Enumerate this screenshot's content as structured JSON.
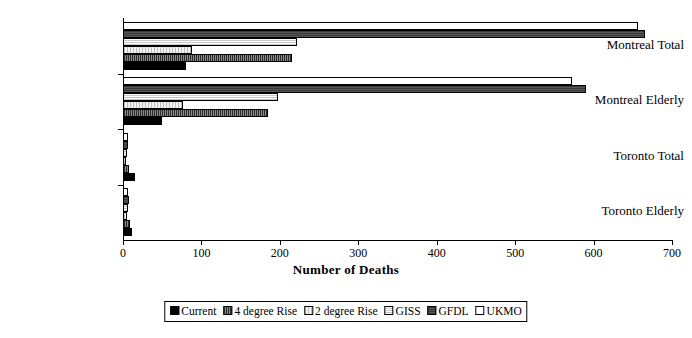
{
  "chart_data": {
    "type": "bar",
    "orientation": "horizontal",
    "title": "",
    "xlabel": "Number of Deaths",
    "ylabel": "",
    "xlim": [
      0,
      700
    ],
    "xticks": [
      0,
      100,
      200,
      300,
      400,
      500,
      600,
      700
    ],
    "grid": false,
    "legend_position": "bottom",
    "categories": [
      "Montreal Total",
      "Montreal Elderly",
      "Toronto Total",
      "Toronto Elderly"
    ],
    "series": [
      {
        "name": "Current",
        "values": [
          80,
          50,
          15,
          12
        ]
      },
      {
        "name": "4 degree Rise",
        "values": [
          215,
          185,
          8,
          9
        ]
      },
      {
        "name": "2 degree Rise",
        "values": [
          88,
          77,
          4,
          5
        ]
      },
      {
        "name": "GISS",
        "values": [
          222,
          198,
          5,
          6
        ]
      },
      {
        "name": "GFDL",
        "values": [
          665,
          590,
          7,
          8
        ]
      },
      {
        "name": "UKMO",
        "values": [
          657,
          573,
          6,
          7
        ]
      }
    ]
  },
  "axis": {
    "x_title": "Number of Deaths",
    "tick_labels": [
      "0",
      "100",
      "200",
      "300",
      "400",
      "500",
      "600",
      "700"
    ]
  },
  "categories": [
    {
      "label": "Montreal Total"
    },
    {
      "label": "Montreal Elderly"
    },
    {
      "label": "Toronto Total"
    },
    {
      "label": "Toronto Elderly"
    }
  ],
  "legend": {
    "items": [
      {
        "label": "Current",
        "color": "#000000"
      },
      {
        "label": "4 degree Rise",
        "color": "#5a5a5a"
      },
      {
        "label": "2 degree Rise",
        "color": "#e8e8e8"
      },
      {
        "label": "GISS",
        "color": "#d8d8d8"
      },
      {
        "label": "GFDL",
        "color": "#454545"
      },
      {
        "label": "UKMO",
        "color": "#ffffff"
      }
    ]
  }
}
